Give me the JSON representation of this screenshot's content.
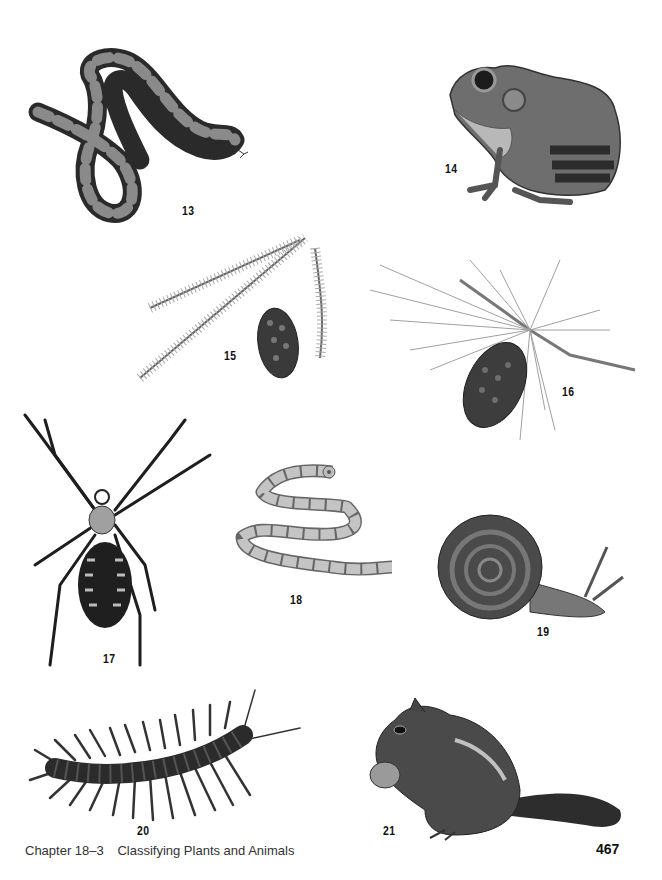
{
  "figures": [
    {
      "number": "13",
      "subject": "snake"
    },
    {
      "number": "14",
      "subject": "frog"
    },
    {
      "number": "15",
      "subject": "spruce-branch-with-cone"
    },
    {
      "number": "16",
      "subject": "pine-branch-with-cone"
    },
    {
      "number": "17",
      "subject": "spider"
    },
    {
      "number": "18",
      "subject": "tapeworm"
    },
    {
      "number": "19",
      "subject": "snail"
    },
    {
      "number": "20",
      "subject": "centipede"
    },
    {
      "number": "21",
      "subject": "chipmunk"
    }
  ],
  "footer": {
    "section": "Chapter 18–3",
    "title": "Classifying Plants and Animals",
    "page_number": "467"
  }
}
